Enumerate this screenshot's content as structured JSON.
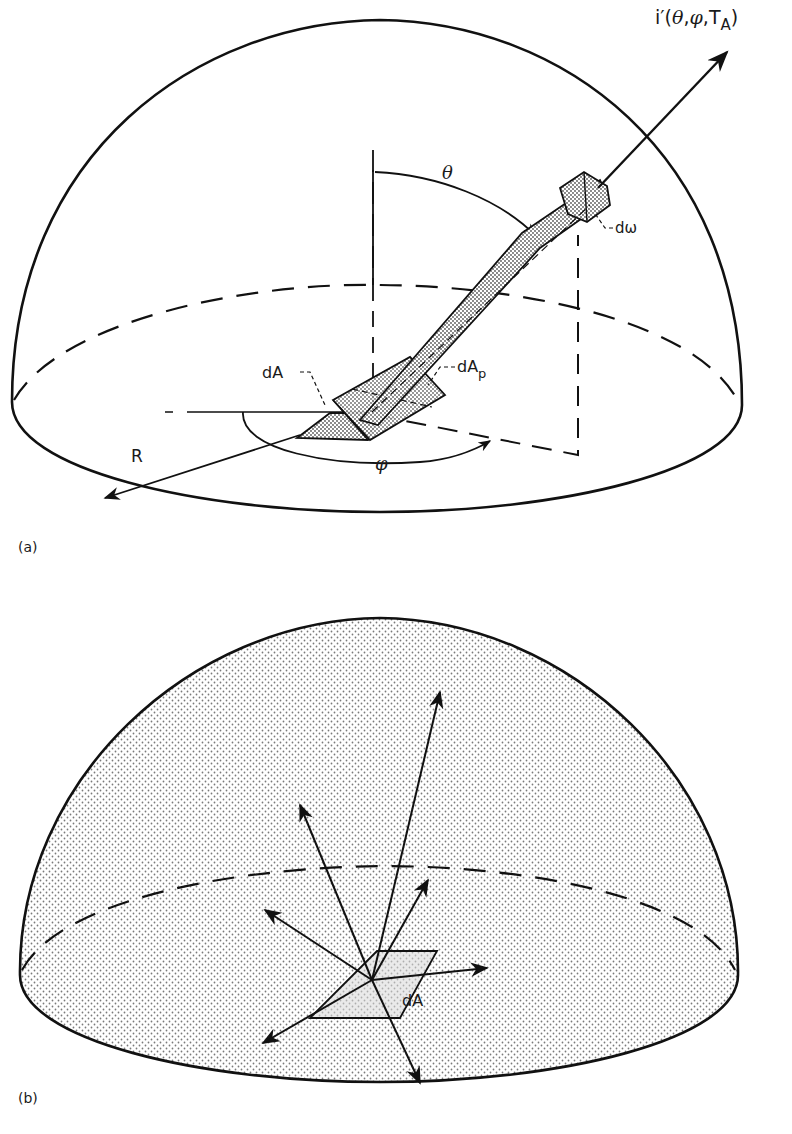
{
  "figure_a": {
    "panel_label": "(a)",
    "intensity_label_prefix": "i′(",
    "intensity_theta": "θ",
    "intensity_sep1": ",",
    "intensity_phi": "φ",
    "intensity_sep2": ",",
    "intensity_T": "T",
    "intensity_sub": "A",
    "intensity_close": ")",
    "theta_label": "θ",
    "phi_label": "φ",
    "radius_label": "R",
    "solid_angle_label": "dω",
    "area_label": "dA",
    "projected_area_label": "dA",
    "projected_area_sub": "p"
  },
  "figure_b": {
    "panel_label": "(b)",
    "area_label": "dA"
  },
  "colors": {
    "ink": "#111111",
    "stipple": "#8a8a8a",
    "background": "#ffffff"
  }
}
